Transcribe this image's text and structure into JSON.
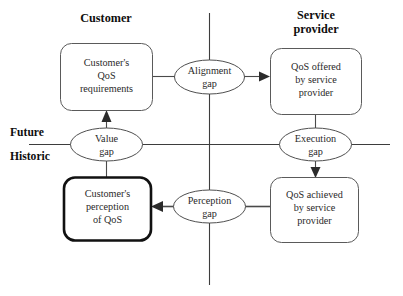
{
  "diagram": {
    "type": "flow-diagram",
    "headings": [
      {
        "id": "customer",
        "label": "Customer"
      },
      {
        "id": "service-provider",
        "label_line1": "Service",
        "label_line2": "provider"
      }
    ],
    "axis": {
      "vertical_label": "",
      "horizontal_labels": [
        {
          "id": "future",
          "label": "Future"
        },
        {
          "id": "historic",
          "label": "Historic"
        }
      ]
    },
    "nodes": [
      {
        "id": "customer-qos-requirements",
        "lines": [
          "Customer's",
          "QoS",
          "requirements"
        ],
        "emphasis": "normal",
        "quadrant": "top-left"
      },
      {
        "id": "qos-offered-by-service-provider",
        "lines": [
          "QoS offered",
          "by service",
          "provider"
        ],
        "emphasis": "normal",
        "quadrant": "top-right"
      },
      {
        "id": "customer-perception-of-qos",
        "lines": [
          "Customer's",
          "perception",
          "of QoS"
        ],
        "emphasis": "bold",
        "quadrant": "bottom-left"
      },
      {
        "id": "qos-achieved-by-service-provider",
        "lines": [
          "QoS achieved",
          "by service",
          "provider"
        ],
        "emphasis": "normal",
        "quadrant": "bottom-right"
      }
    ],
    "gaps": [
      {
        "id": "alignment-gap",
        "line1": "Alignment",
        "line2": "gap",
        "from": "customer-qos-requirements",
        "to": "qos-offered-by-service-provider",
        "direction": "right"
      },
      {
        "id": "value-gap",
        "line1": "Value",
        "line2": "gap",
        "from": "customer-perception-of-qos",
        "to": "customer-qos-requirements",
        "direction": "up"
      },
      {
        "id": "execution-gap",
        "line1": "Execution",
        "line2": "gap",
        "from": "qos-offered-by-service-provider",
        "to": "qos-achieved-by-service-provider",
        "direction": "down"
      },
      {
        "id": "perception-gap",
        "line1": "Perception",
        "line2": "gap",
        "from": "qos-achieved-by-service-provider",
        "to": "customer-perception-of-qos",
        "direction": "left"
      }
    ],
    "colors": {
      "background": "#ffffff",
      "line": "#4a4a4a",
      "axis": "#3d3d3d",
      "text": "#2a2a2a",
      "emphasis_border": "#111111"
    }
  }
}
